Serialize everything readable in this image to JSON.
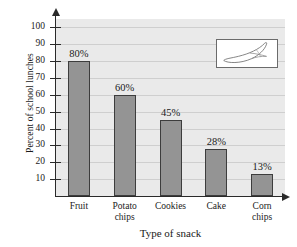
{
  "figure": {
    "clipped_top_text": "",
    "inset_icon": "banana-illustration"
  },
  "chart_data": {
    "type": "bar",
    "title": "",
    "categories": [
      "Fruit",
      "Potato\nchips",
      "Cookies",
      "Cake",
      "Corn\nchips"
    ],
    "values": [
      80,
      60,
      45,
      28,
      13
    ],
    "data_labels": [
      "80%",
      "60%",
      "45%",
      "28%",
      "13%"
    ],
    "xlabel": "Type of snack",
    "ylabel": "Percent of school lunches",
    "ylim": [
      0,
      105
    ],
    "ytick_values": [
      10,
      20,
      30,
      40,
      50,
      60,
      70,
      80,
      90,
      100
    ],
    "ytick_labels": [
      "10",
      "20",
      "30",
      "40",
      "50",
      "60",
      "70",
      "80",
      "90",
      "100"
    ],
    "grid": true,
    "grid_axis": "y",
    "legend": "none",
    "bar_color": "#949494",
    "bar_edge_color": "#3d3d3d",
    "plot_background": "#eaeaea",
    "axis_color": "#2a2a2a"
  }
}
